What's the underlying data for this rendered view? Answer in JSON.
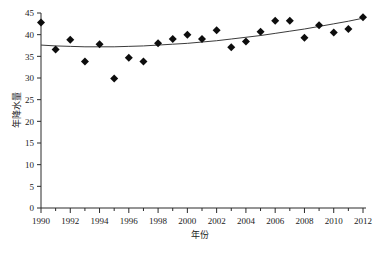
{
  "chart_data": {
    "type": "scatter",
    "title": "",
    "xlabel": "年份",
    "ylabel": "年降水量",
    "xlim": [
      1990,
      2012
    ],
    "ylim": [
      0,
      45
    ],
    "grid": false,
    "legend": null,
    "xticks": [
      1990,
      1992,
      1994,
      1996,
      1998,
      2000,
      2002,
      2004,
      2006,
      2008,
      2010,
      2012
    ],
    "xtick_labels": [
      "1990",
      "1992",
      "1994",
      "1996",
      "1998",
      "2000",
      "2002",
      "2004",
      "2006",
      "2008",
      "2010",
      "2012"
    ],
    "xtick_minor": [
      1991,
      1993,
      1995,
      1997,
      1999,
      2001,
      2003,
      2005,
      2007,
      2009,
      2011
    ],
    "yticks": [
      0,
      5,
      10,
      15,
      20,
      25,
      30,
      35,
      40,
      45
    ],
    "ytick_labels": [
      "0",
      "5",
      "10",
      "15",
      "20",
      "25",
      "30",
      "35",
      "40",
      "45"
    ],
    "marker_style": "filled-diamond",
    "marker_color": "#0d0d0d",
    "trend_color": "#3b3b3b",
    "trend_type": "quadratic-fit",
    "x": [
      1990,
      1991,
      1992,
      1993,
      1994,
      1995,
      1996,
      1997,
      1998,
      1999,
      2000,
      2001,
      2002,
      2003,
      2004,
      2005,
      2006,
      2007,
      2008,
      2009,
      2010,
      2011,
      2012
    ],
    "values": [
      42.8,
      36.6,
      38.8,
      33.8,
      37.8,
      29.9,
      34.7,
      33.8,
      38.0,
      39.0,
      40.0,
      39.0,
      41.0,
      37.1,
      38.4,
      40.7,
      43.2,
      43.2,
      39.3,
      42.2,
      40.5,
      41.3,
      44.0
    ],
    "series": [
      {
        "name": "年降水量",
        "values": [
          42.8,
          36.6,
          38.8,
          33.8,
          37.8,
          29.9,
          34.7,
          33.8,
          38.0,
          39.0,
          40.0,
          39.0,
          41.0,
          37.1,
          38.4,
          40.7,
          43.2,
          43.2,
          39.3,
          42.2,
          40.5,
          41.3,
          44.0
        ]
      },
      {
        "name": "趋势线",
        "values": [
          37.6,
          37.4,
          37.3,
          37.2,
          37.2,
          37.2,
          37.3,
          37.4,
          37.6,
          37.8,
          38.0,
          38.3,
          38.6,
          39.0,
          39.4,
          39.8,
          40.3,
          40.8,
          41.3,
          41.9,
          42.5,
          43.1,
          43.8
        ]
      }
    ]
  },
  "axes": {
    "y_title": "年降水量",
    "x_title": "年份"
  }
}
